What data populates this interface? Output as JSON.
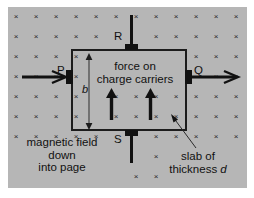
{
  "figure": {
    "background_color": "#b6b6b6",
    "line_color": "#111111",
    "field_symbol": "×",
    "field_grid": {
      "cols": 12,
      "rows": 9,
      "spacing_x": 20,
      "spacing_y": 20
    }
  },
  "labels": {
    "terminal_p": "P",
    "terminal_q": "Q",
    "terminal_r": "R",
    "terminal_s": "S",
    "height_b": "b",
    "force_line1": "force on",
    "force_line2": "charge carriers",
    "field_line1": "magnetic field",
    "field_line2": "down",
    "field_line3": "into page",
    "slab_line1": "slab of",
    "slab_line2_prefix": "thickness ",
    "slab_line2_symbol": "d"
  }
}
